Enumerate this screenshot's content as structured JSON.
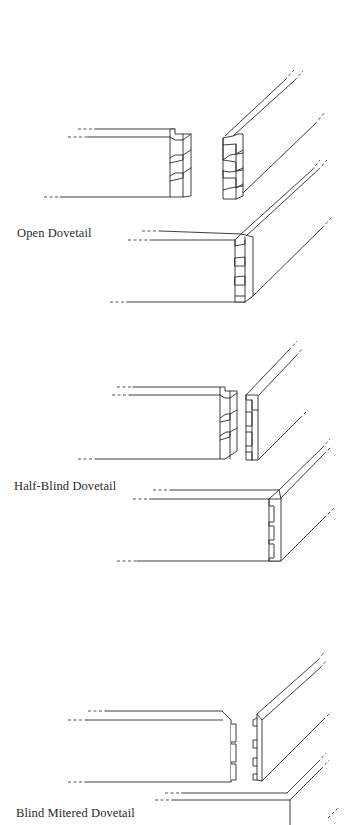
{
  "figure": {
    "type": "technical-illustration",
    "line_color": "#2a2a2a",
    "background": "#ffffff"
  },
  "joints": [
    {
      "id": "open",
      "label": "Open Dovetail",
      "views": [
        "exploded",
        "assembled"
      ],
      "tails": 3
    },
    {
      "id": "half-blind",
      "label": "Half-Blind Dovetail",
      "views": [
        "exploded",
        "assembled"
      ],
      "tails": 3
    },
    {
      "id": "blind-mitered",
      "label": "Blind Mitered Dovetail",
      "views": [
        "exploded",
        "assembled"
      ],
      "tails": 3
    }
  ]
}
